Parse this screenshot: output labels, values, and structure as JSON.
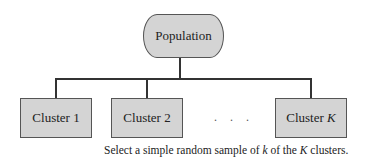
{
  "diagram": {
    "root": {
      "label": "Population"
    },
    "clusters": [
      {
        "label": "Cluster 1"
      },
      {
        "label": "Cluster 2"
      },
      {
        "label": "Cluster ",
        "italic_suffix": "K"
      }
    ],
    "ellipsis": ". . .",
    "caption": {
      "part1": "Select a simple random sample of ",
      "var1": "k",
      "part2": " of the ",
      "var2": "K",
      "part3": " clusters."
    },
    "colors": {
      "box_fill": "#d4d4d4",
      "box_border": "#555555",
      "line": "#333333"
    }
  }
}
